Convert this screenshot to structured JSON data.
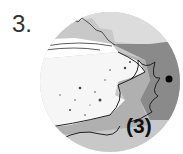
{
  "figure": {
    "number": "3.",
    "label": "(3)",
    "colors": {
      "sky": "#dcdcdc",
      "water_dark": "#8a8a8a",
      "water_mid": "#b0b0b0",
      "water_light": "#c8c8c8",
      "sand": "#f4f4f4",
      "line": "#222222",
      "marker": "#000000"
    }
  }
}
